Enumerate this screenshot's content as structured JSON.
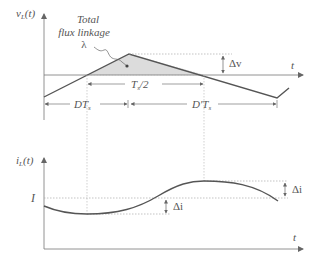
{
  "figure": {
    "top_plot": {
      "y_axis_label": "v",
      "y_axis_sub": "L",
      "y_axis_arg": "(t)",
      "x_axis_label": "t",
      "annotation_line1": "Total",
      "annotation_line2": "flux linkage",
      "annotation_symbol": "λ",
      "delta_v_label": "Δv",
      "half_period_label": "T",
      "half_period_sub": "s",
      "half_period_suffix": "/2",
      "d_label": "DT",
      "d_sub": "s",
      "dprime_label": "D′T",
      "dprime_sub": "s"
    },
    "bottom_plot": {
      "y_axis_label": "i",
      "y_axis_sub": "L",
      "y_axis_arg": "(t)",
      "x_axis_label": "t",
      "dc_level_label": "I",
      "delta_i_low_label": "Δi",
      "delta_i_high_label": "Δi"
    },
    "colors": {
      "waveform": "#555555",
      "axis": "#777777",
      "dotted": "#aaaaaa",
      "shade": "#d8d8d8",
      "text": "#555555"
    }
  }
}
